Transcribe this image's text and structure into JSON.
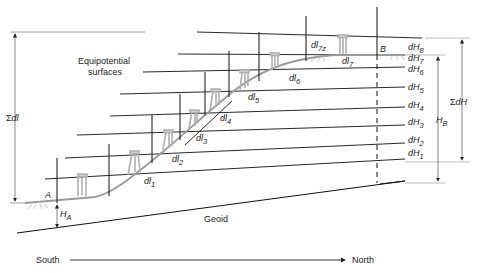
{
  "figure": {
    "equipotential_label_line1": "Equipotential",
    "equipotential_label_line2": "surfaces",
    "geoid_label": "Geoid",
    "point_a": "A",
    "point_b": "B",
    "height_a": {
      "base": "H",
      "sub": "A"
    },
    "height_b": {
      "base": "H",
      "sub": "B"
    },
    "sum_dl": {
      "sym": "Σ",
      "text": "dl"
    },
    "sum_dh": {
      "sym": "Σ",
      "text": "dH"
    },
    "direction_start": "South",
    "direction_end": "North",
    "dl_labels": [
      {
        "base": "dl",
        "sub": "1"
      },
      {
        "base": "dl",
        "sub": "2"
      },
      {
        "base": "dl",
        "sub": "3"
      },
      {
        "base": "dl",
        "sub": "4"
      },
      {
        "base": "dl",
        "sub": "5"
      },
      {
        "base": "dl",
        "sub": "6"
      },
      {
        "base": "dl",
        "sub": "7"
      },
      {
        "base": "dl",
        "sub": "7z"
      }
    ],
    "dh_labels": [
      {
        "base": "dH",
        "sub": "1"
      },
      {
        "base": "dH",
        "sub": "2"
      },
      {
        "base": "dH",
        "sub": "3"
      },
      {
        "base": "dH",
        "sub": "4"
      },
      {
        "base": "dH",
        "sub": "5"
      },
      {
        "base": "dH",
        "sub": "6"
      },
      {
        "base": "dH",
        "sub": "7"
      },
      {
        "base": "dH",
        "sub": "8"
      }
    ],
    "colors": {
      "line": "#111111",
      "terrain": "#9a9a9a",
      "instrument": "#b0b0b0",
      "dim": "#555555"
    }
  }
}
